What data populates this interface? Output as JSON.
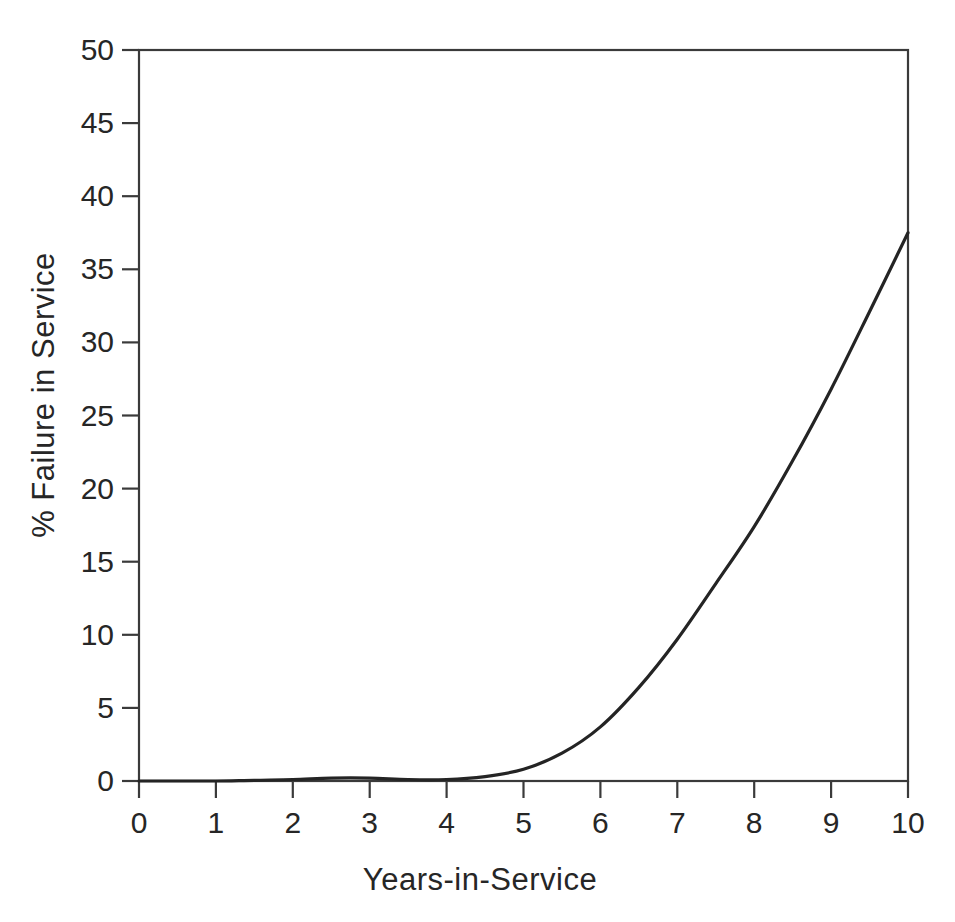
{
  "page": {
    "background": "#ffffff",
    "ink_color": "#2a2a2a"
  },
  "chart_data": {
    "type": "line",
    "title": "",
    "xlabel": "Years-in-Service",
    "ylabel": "% Failure in Service",
    "xlim": [
      0,
      10
    ],
    "ylim": [
      0,
      50
    ],
    "x_ticks": [
      "0",
      "1",
      "2",
      "3",
      "4",
      "5",
      "6",
      "7",
      "8",
      "9",
      "10"
    ],
    "y_ticks": [
      "0",
      "5",
      "10",
      "15",
      "20",
      "25",
      "30",
      "35",
      "40",
      "45",
      "50"
    ],
    "grid": false,
    "legend": "none",
    "frame": "full-box",
    "axis_color": "#3a3a3a",
    "line_color": "#242424",
    "series": [
      {
        "name": "% Failure in Service",
        "x": [
          0,
          0.5,
          1,
          1.5,
          2,
          2.5,
          3,
          3.5,
          4,
          4.5,
          5,
          5.5,
          6,
          6.5,
          7,
          7.5,
          8,
          8.5,
          9,
          9.5,
          10
        ],
        "y": [
          0,
          0,
          0,
          0.05,
          0.1,
          0.2,
          0.2,
          0.1,
          0.1,
          0.3,
          0.8,
          1.9,
          3.7,
          6.4,
          9.7,
          13.5,
          17.4,
          21.9,
          26.8,
          32.1,
          37.5
        ]
      }
    ]
  }
}
